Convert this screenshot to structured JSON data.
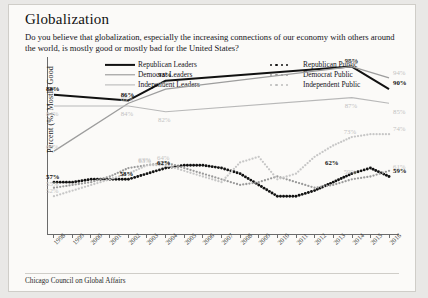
{
  "header": {
    "title": "Globalization",
    "question": "Do you believe that globalization, especially the increasing connections of our economy with others around the world, is mostly good or mostly bad for the United States?"
  },
  "footer": {
    "source": "Chicago Council on Global Affairs"
  },
  "legend": [
    {
      "label": "Republican Leaders",
      "style": "solid",
      "color": "#111111"
    },
    {
      "label": "Democrat Leaders",
      "style": "solid",
      "color": "#8e8e8e"
    },
    {
      "label": "Independent Leaders",
      "style": "solid",
      "color": "#b4b4b4"
    },
    {
      "label": "Republican Public",
      "style": "dotted",
      "color": "#111111"
    },
    {
      "label": "Democrat Public",
      "style": "dotted",
      "color": "#9a9a9a"
    },
    {
      "label": "Independent Public",
      "style": "dotted",
      "color": "#bdbdbd"
    }
  ],
  "chart_data": {
    "type": "line",
    "title": "Globalization",
    "xlabel": "",
    "ylabel": "Percent (%) Mostly Good",
    "ylim": [
      40,
      100
    ],
    "grid": false,
    "legend_position": "top",
    "categories": [
      "1998",
      "1999",
      "2000",
      "2001",
      "2002",
      "2003",
      "2004",
      "2005",
      "2006",
      "2007",
      "2008",
      "2009",
      "2010",
      "2011",
      "2012",
      "2013",
      "2014",
      "2015",
      "2016"
    ],
    "series": [
      {
        "name": "Republican Leaders",
        "color": "#111111",
        "style": "solid",
        "values": [
          88,
          null,
          null,
          null,
          86,
          null,
          93,
          null,
          null,
          null,
          null,
          null,
          null,
          null,
          null,
          null,
          98,
          null,
          90
        ],
        "labels": [
          {
            "x": "1998",
            "value": 88,
            "text": "88%",
            "emphasis": "dark"
          },
          {
            "x": "2002",
            "value": 86,
            "text": "86%",
            "emphasis": "dark"
          },
          {
            "x": "2004",
            "value": 93,
            "text": "93%",
            "emphasis": "dark"
          },
          {
            "x": "2014",
            "value": 98,
            "text": "98%",
            "emphasis": "dark"
          },
          {
            "x": "2016",
            "value": 90,
            "text": "90%",
            "emphasis": "dark"
          }
        ]
      },
      {
        "name": "Democrat Leaders",
        "color": "#9d9d9d",
        "style": "solid",
        "values": [
          68,
          null,
          null,
          null,
          85,
          null,
          90,
          null,
          null,
          null,
          null,
          null,
          null,
          null,
          null,
          null,
          98,
          null,
          94
        ],
        "labels": [
          {
            "x": "1998",
            "value": 68,
            "text": "68%",
            "emphasis": "light"
          },
          {
            "x": "2002",
            "value": 85,
            "text": "85%",
            "emphasis": "light"
          },
          {
            "x": "2004",
            "value": 90,
            "text": "90%",
            "emphasis": "light"
          },
          {
            "x": "2014",
            "value": 98,
            "text": "98%",
            "emphasis": "light"
          },
          {
            "x": "2016",
            "value": 94,
            "text": "94%",
            "emphasis": "light"
          }
        ]
      },
      {
        "name": "Independent Leaders",
        "color": "#b8b8b8",
        "style": "solid",
        "values": [
          84,
          null,
          null,
          null,
          84,
          null,
          82,
          null,
          null,
          null,
          null,
          null,
          null,
          null,
          null,
          null,
          87,
          null,
          85
        ],
        "labels": [
          {
            "x": "1998",
            "value": 84,
            "text": "84%",
            "emphasis": "light"
          },
          {
            "x": "2002",
            "value": 84,
            "text": "84%",
            "emphasis": "light"
          },
          {
            "x": "2004",
            "value": 82,
            "text": "82%",
            "emphasis": "light"
          },
          {
            "x": "2014",
            "value": 87,
            "text": "87%",
            "emphasis": "light"
          },
          {
            "x": "2016",
            "value": 85,
            "text": "85%",
            "emphasis": "light"
          }
        ]
      },
      {
        "name": "Republican Public",
        "color": "#111111",
        "style": "dotted",
        "values": [
          57,
          57,
          58,
          58,
          58,
          60,
          62,
          63,
          63,
          62,
          60,
          56,
          52,
          52,
          54,
          57,
          60,
          62,
          59
        ],
        "labels": [
          {
            "x": "1998",
            "value": 57,
            "text": "57%",
            "emphasis": "dark"
          },
          {
            "x": "2002",
            "value": 58,
            "text": "58%",
            "emphasis": "dark"
          },
          {
            "x": "2004",
            "value": 62,
            "text": "62%",
            "emphasis": "dark"
          },
          {
            "x": "2013",
            "value": 62,
            "text": "62%",
            "emphasis": "dark"
          },
          {
            "x": "2016",
            "value": 59,
            "text": "59%",
            "emphasis": "dark"
          }
        ]
      },
      {
        "name": "Democrat Public",
        "color": "#9a9a9a",
        "style": "dotted",
        "values": [
          55,
          56,
          57,
          59,
          62,
          63,
          64,
          62,
          60,
          58,
          56,
          57,
          59,
          57,
          55,
          56,
          58,
          59,
          61
        ],
        "labels": [
          {
            "x": "1998",
            "value": 55,
            "text": "55%",
            "emphasis": "light"
          },
          {
            "x": "2003",
            "value": 63,
            "text": "63%",
            "emphasis": "light"
          },
          {
            "x": "2004",
            "value": 64,
            "text": "64%",
            "emphasis": "light"
          },
          {
            "x": "2014",
            "value": 59,
            "text": "59%",
            "emphasis": "light"
          },
          {
            "x": "2016",
            "value": 61,
            "text": "61%",
            "emphasis": "light"
          }
        ]
      },
      {
        "name": "Independent Public",
        "color": "#c6c6c6",
        "style": "dotted",
        "values": [
          52,
          54,
          56,
          58,
          60,
          63,
          63,
          61,
          59,
          57,
          64,
          66,
          58,
          60,
          66,
          70,
          73,
          74,
          74
        ],
        "labels": [
          {
            "x": "1998",
            "value": 52,
            "text": "52%",
            "emphasis": "light"
          },
          {
            "x": "2003",
            "value": 63,
            "text": "63%",
            "emphasis": "light"
          },
          {
            "x": "2014",
            "value": 73,
            "text": "73%",
            "emphasis": "light"
          },
          {
            "x": "2016",
            "value": 74,
            "text": "74%",
            "emphasis": "light"
          }
        ]
      }
    ]
  }
}
